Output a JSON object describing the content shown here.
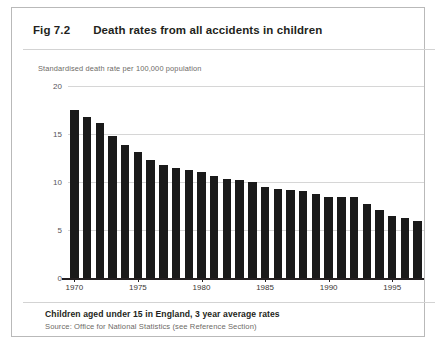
{
  "figure": {
    "number": "Fig 7.2",
    "title": "Death rates from all accidents in children",
    "footnote": "Children aged under 15 in England, 3 year average rates",
    "source": "Source: Office for National Statistics (see Reference Section)"
  },
  "chart_data": {
    "type": "bar",
    "title": "Death rates from all accidents in children",
    "subtitle": "Children aged under 15 in England, 3 year average rates",
    "xlabel": "",
    "ylabel": "Standardised death rate per 100,000 population",
    "ylim": [
      0,
      20
    ],
    "yticks": [
      0,
      5,
      10,
      15,
      20
    ],
    "ytick_labels": [
      "0",
      "5",
      "10",
      "15",
      "20"
    ],
    "xticks": [
      1970,
      1975,
      1980,
      1985,
      1990,
      1995
    ],
    "xtick_labels": [
      "1970",
      "1975",
      "1980",
      "1985",
      "1990",
      "1995"
    ],
    "grid": true,
    "legend": false,
    "bar_color": "#1a1a1a",
    "categories": [
      "1970",
      "1971",
      "1972",
      "1973",
      "1974",
      "1975",
      "1976",
      "1977",
      "1978",
      "1979",
      "1980",
      "1981",
      "1982",
      "1983",
      "1984",
      "1985",
      "1986",
      "1987",
      "1988",
      "1989",
      "1990",
      "1991",
      "1992",
      "1993",
      "1994",
      "1995",
      "1996",
      "1997"
    ],
    "values": [
      17.5,
      16.8,
      16.1,
      14.8,
      13.9,
      13.1,
      12.3,
      11.8,
      11.5,
      11.2,
      11.0,
      10.6,
      10.3,
      10.2,
      10.0,
      9.5,
      9.3,
      9.2,
      9.1,
      8.7,
      8.4,
      8.4,
      8.4,
      7.7,
      7.1,
      6.5,
      6.2,
      5.9
    ]
  }
}
